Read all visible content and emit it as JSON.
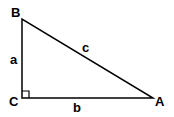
{
  "diagram": {
    "type": "right-triangle",
    "stroke_color": "#000000",
    "vertices": {
      "B": {
        "label": "B",
        "x": 22,
        "y": 19
      },
      "C": {
        "label": "C",
        "x": 22,
        "y": 98
      },
      "A": {
        "label": "A",
        "x": 153,
        "y": 98
      }
    },
    "sides": {
      "a": {
        "label": "a"
      },
      "b": {
        "label": "b"
      },
      "c": {
        "label": "c"
      }
    },
    "right_angle_at": "C"
  }
}
